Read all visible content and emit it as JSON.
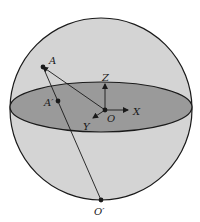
{
  "diagram": {
    "type": "sphere-projection",
    "colors": {
      "sphere_fill": "#d4d4d4",
      "equator_fill": "#9a9a9a",
      "stroke": "#1a1a1a",
      "background": "#ffffff"
    },
    "sphere": {
      "cx": 101,
      "cy": 109,
      "r": 91
    },
    "equator": {
      "cx": 101,
      "cy": 107,
      "rx": 91,
      "ry": 25
    },
    "points": [
      {
        "id": "A",
        "label": "A",
        "x": 43,
        "y": 67,
        "label_x": 49,
        "label_y": 64
      },
      {
        "id": "A_prime",
        "label": "A′",
        "x": 58,
        "y": 101,
        "label_x": 44,
        "label_y": 106
      },
      {
        "id": "O",
        "label": "O",
        "x": 105,
        "y": 110,
        "label_x": 107,
        "label_y": 122
      },
      {
        "id": "O_prime",
        "label": "O′",
        "x": 101,
        "y": 200,
        "label_x": 94,
        "label_y": 215
      }
    ],
    "axes": [
      {
        "id": "Z",
        "label": "Z",
        "x2": 105,
        "y2": 84,
        "label_x": 102,
        "label_y": 81
      },
      {
        "id": "X",
        "label": "X",
        "x2": 128,
        "y2": 110,
        "label_x": 133,
        "label_y": 115
      },
      {
        "id": "Y",
        "label": "Y",
        "x2": 93,
        "y2": 118,
        "label_x": 83,
        "label_y": 130
      }
    ],
    "segments": [
      {
        "from": "O",
        "to": "A",
        "arrow": true
      },
      {
        "from": "A",
        "to": "O_prime",
        "arrow": false
      }
    ]
  }
}
